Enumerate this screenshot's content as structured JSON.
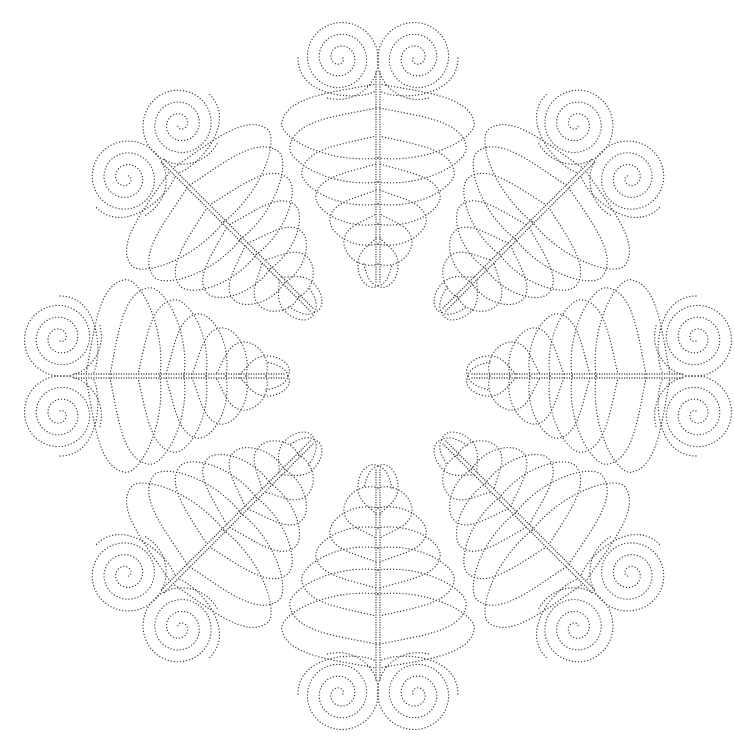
{
  "page": {
    "header_text": "",
    "background": "#ffffff",
    "ink_color": "#3a3a3a"
  },
  "design": {
    "name": "Feathered Spiral Wreath",
    "type": "quilting stencil",
    "center": [
      378,
      376
    ],
    "motif_count": 8,
    "rotation_step_deg": 45,
    "motif": {
      "tip_radius": 90,
      "spine_end_radius": 305,
      "spiral_offset": 38,
      "spiral_center_radius": 318,
      "spiral_max_radius": 42,
      "spiral_turns": 3.3,
      "feathers": [
        {
          "start": 90,
          "end": 128,
          "width": 20
        },
        {
          "start": 112,
          "end": 152,
          "width": 34
        },
        {
          "start": 132,
          "end": 176,
          "width": 48
        },
        {
          "start": 152,
          "end": 202,
          "width": 62
        },
        {
          "start": 172,
          "end": 230,
          "width": 76
        },
        {
          "start": 194,
          "end": 258,
          "width": 88
        },
        {
          "start": 218,
          "end": 282,
          "width": 96
        }
      ]
    }
  }
}
